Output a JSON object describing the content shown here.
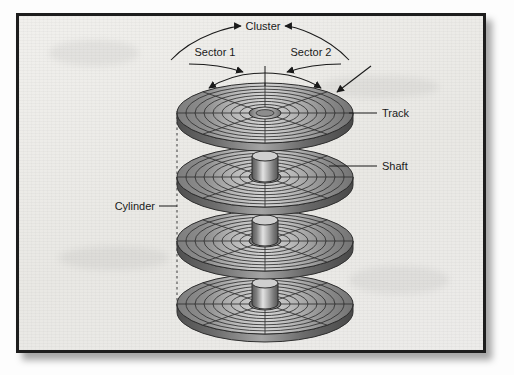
{
  "figure": {
    "kind": "disk-platter-stack-diagram",
    "title_bleed": "",
    "frame": {
      "border_color": "#1d1d1d",
      "background_color": "#eeedea",
      "shadow": true,
      "x": 16,
      "y": 13,
      "width": 470,
      "height": 340
    }
  },
  "labels": {
    "cluster": "Cluster",
    "sector_1": "Sector 1",
    "sector_2": "Sector 2",
    "track": "Track",
    "shaft": "Shaft",
    "cylinder": "Cylinder"
  },
  "callouts": [
    {
      "name": "cluster",
      "text": "Cluster",
      "x": 252,
      "y": 30,
      "anchor": "middle",
      "arrow": "double-curved-arc"
    },
    {
      "name": "sector-1",
      "text": "Sector 1",
      "x": 212,
      "y": 53,
      "anchor": "middle",
      "arrow": "double-curved-arc"
    },
    {
      "name": "sector-2",
      "text": "Sector 2",
      "x": 305,
      "y": 53,
      "anchor": "middle",
      "arrow": "double-curved-arc"
    },
    {
      "name": "track",
      "text": "Track",
      "x": 381,
      "y": 113,
      "anchor": "start",
      "arrow": "leader-line"
    },
    {
      "name": "shaft",
      "text": "Shaft",
      "x": 381,
      "y": 167,
      "anchor": "start",
      "arrow": "leader-line"
    },
    {
      "name": "cylinder",
      "text": "Cylinder",
      "x": 122,
      "y": 203,
      "anchor": "start",
      "arrow": "leader-line-dashed"
    }
  ],
  "platters": [
    {
      "index": 1,
      "cx": 262,
      "cy": 110,
      "rx": 88,
      "ry": 30,
      "tracks": 8,
      "sectors": 8,
      "hole_rx": 16,
      "hole_ry": 6
    },
    {
      "index": 2,
      "cx": 262,
      "cy": 174,
      "rx": 88,
      "ry": 30,
      "tracks": 8,
      "sectors": 8,
      "hole_rx": 16,
      "hole_ry": 6
    },
    {
      "index": 3,
      "cx": 262,
      "cy": 238,
      "rx": 88,
      "ry": 30,
      "tracks": 8,
      "sectors": 8,
      "hole_rx": 16,
      "hole_ry": 6
    },
    {
      "index": 4,
      "cx": 262,
      "cy": 301,
      "rx": 88,
      "ry": 30,
      "tracks": 8,
      "sectors": 8,
      "hole_rx": 16,
      "hole_ry": 6
    }
  ],
  "shaft_segments": [
    {
      "cx": 262,
      "top_y": 152,
      "bottom_y": 176,
      "rx": 13
    },
    {
      "cx": 262,
      "top_y": 216,
      "bottom_y": 240,
      "rx": 13
    },
    {
      "cx": 262,
      "top_y": 280,
      "bottom_y": 303,
      "rx": 13
    }
  ],
  "cylinder_guide": {
    "x": 176,
    "y_top": 108,
    "y_bottom": 306,
    "style": "dashed"
  },
  "colors": {
    "platter_dark": "#6e6e6e",
    "platter_mid": "#9a9a9a",
    "platter_light": "#d8d8d8",
    "platter_edge": "#4a4a4a",
    "line": "#1a1a1a",
    "text": "#1a1a1a",
    "frame_border": "#1d1d1d",
    "paper": "#eeedea"
  }
}
